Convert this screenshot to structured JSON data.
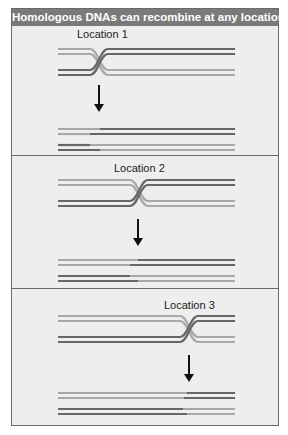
{
  "title": "Homologous DNAs can recombine at any location",
  "colors": {
    "header_bg": "#7a7a7a",
    "panel_bg": "#eeeeee",
    "dark_strand": "#666666",
    "light_strand": "#a8a8a8",
    "arrow": "#111111"
  },
  "panels": [
    {
      "label": "Location 1",
      "crossover_x": 98
    },
    {
      "label": "Location 2",
      "crossover_x": 138
    },
    {
      "label": "Location 3",
      "crossover_x": 188
    }
  ]
}
